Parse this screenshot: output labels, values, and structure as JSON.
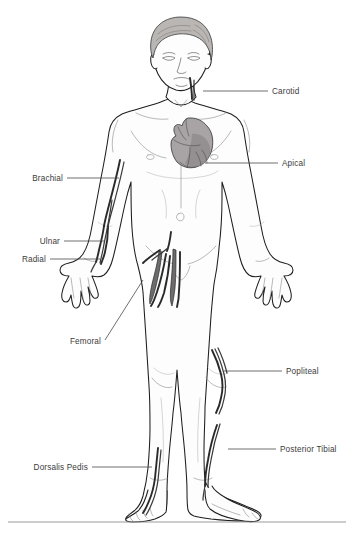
{
  "figure": {
    "background_color": "#ffffff",
    "line_color": "#1e1e1e",
    "label_color": "#3c3c3c",
    "artery_color": "#2a2a2a",
    "heart_color": "#a8a3a5",
    "hair_color": "#b9b6b4"
  },
  "labels": [
    {
      "id": "carotid",
      "text": "Carotid",
      "side": "right",
      "text_x": 272,
      "text_y": 91,
      "leader": "M 203 91 L 268 91",
      "site": "neck"
    },
    {
      "id": "apical",
      "text": "Apical",
      "side": "right",
      "text_x": 282,
      "text_y": 163,
      "leader": "M 205 163 L 278 163",
      "site": "heart apex"
    },
    {
      "id": "brachial",
      "text": "Brachial",
      "side": "left",
      "text_x": 21,
      "text_y": 181,
      "leader": "M 67 178 L 119 178",
      "site": "upper arm"
    },
    {
      "id": "ulnar",
      "text": "Ulnar",
      "side": "left",
      "text_x": 34,
      "text_y": 244,
      "leader": "M 64 241 L 105 241",
      "site": "wrist ulnar side"
    },
    {
      "id": "radial",
      "text": "Radial",
      "side": "left",
      "text_x": 14,
      "text_y": 262,
      "leader": "M 50 259 L 100 259",
      "site": "wrist radial side"
    },
    {
      "id": "femoral",
      "text": "Femoral",
      "side": "left",
      "text_x": 60,
      "text_y": 344,
      "leader": "M 105 340 L 143 280",
      "site": "groin"
    },
    {
      "id": "popliteal",
      "text": "Popliteal",
      "side": "right",
      "text_x": 286,
      "text_y": 374,
      "leader": "M 224 371 L 282 371",
      "site": "behind knee"
    },
    {
      "id": "posterior-tibial",
      "text": "Posterior Tibial",
      "side": "right",
      "text_x": 280,
      "text_y": 452,
      "leader": "M 228 449 L 276 449",
      "site": "medial ankle"
    },
    {
      "id": "dorsalis-pedis",
      "text": "Dorsalis Pedis",
      "side": "left",
      "text_x": 18,
      "text_y": 470,
      "leader": "M 92 467 L 152 467",
      "site": "top of foot"
    }
  ],
  "footer_rule": {
    "x1": 8,
    "x2": 346,
    "y": 522
  }
}
